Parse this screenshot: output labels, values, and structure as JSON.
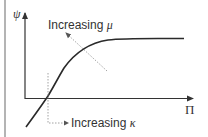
{
  "diagram": {
    "y_axis_label": "ψ",
    "x_axis_label": "Π",
    "annotations": [
      {
        "text": "Increasing ",
        "symbol": "μ",
        "direction": "up-left"
      },
      {
        "text": "Increasing ",
        "symbol": "κ",
        "direction": "right"
      }
    ],
    "colors": {
      "curve": "#2a2a2a",
      "axes": "#333333",
      "dotted_arrow": "#9a9a9a",
      "left_rule": "#b4b4b4"
    }
  }
}
